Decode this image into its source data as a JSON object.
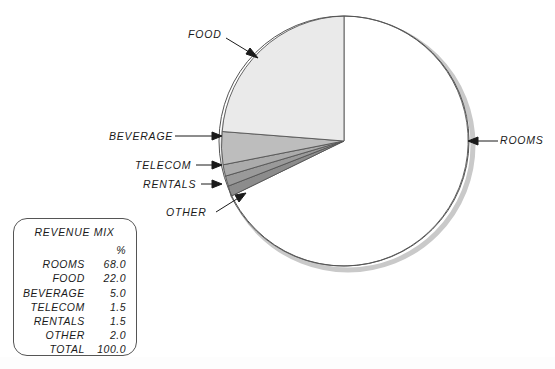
{
  "chart_data": {
    "type": "pie",
    "title": "REVENUE MIX",
    "unit_header": "%",
    "categories": [
      "ROOMS",
      "FOOD",
      "BEVERAGE",
      "TELECOM",
      "RENTALS",
      "OTHER"
    ],
    "values": [
      68.0,
      22.0,
      5.0,
      1.5,
      1.5,
      2.0
    ],
    "total_label": "TOTAL",
    "total_value": 100.0,
    "start_angle_deg": 90,
    "direction": "counterclockwise",
    "legend_position": "bottom-left",
    "grid": false,
    "xlabel": "",
    "ylabel": "",
    "slices": [
      {
        "name": "FOOD",
        "value": 22.0,
        "color": "#eaeaea",
        "label_text": "FOOD"
      },
      {
        "name": "BEVERAGE",
        "value": 5.0,
        "color": "#bdbdbd",
        "label_text": "BEVERAGE"
      },
      {
        "name": "TELECOM",
        "value": 1.5,
        "color": "#ababab",
        "label_text": "TELECOM"
      },
      {
        "name": "RENTALS",
        "value": 1.5,
        "color": "#9a9a9a",
        "label_text": "RENTALS"
      },
      {
        "name": "OTHER",
        "value": 2.0,
        "color": "#8c8c8c",
        "label_text": "OTHER"
      },
      {
        "name": "ROOMS",
        "value": 68.0,
        "color": "#ffffff",
        "label_text": "ROOMS"
      }
    ]
  },
  "chart": {
    "callouts": {
      "food": "FOOD",
      "beverage": "BEVERAGE",
      "telecom": "TELECOM",
      "rentals": "RENTALS",
      "other": "OTHER",
      "rooms": "ROOMS"
    }
  },
  "legend": {
    "title": "REVENUE MIX",
    "percent_header": "%",
    "rows": [
      {
        "label": "ROOMS",
        "value": "68.0"
      },
      {
        "label": "FOOD",
        "value": "22.0"
      },
      {
        "label": "BEVERAGE",
        "value": "5.0"
      },
      {
        "label": "TELECOM",
        "value": "1.5"
      },
      {
        "label": "RENTALS",
        "value": "1.5"
      },
      {
        "label": "OTHER",
        "value": "2.0"
      }
    ],
    "total": {
      "label": "TOTAL",
      "value": "100.0"
    }
  },
  "colors": {
    "outline": "#555555",
    "text": "#1a1a1a",
    "shadow": "#c9c9c9",
    "background": "#ffffff"
  }
}
